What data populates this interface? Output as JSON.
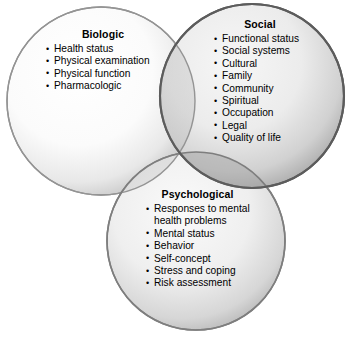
{
  "diagram": {
    "type": "venn-3-circle",
    "background_color": "#ffffff",
    "circles": [
      {
        "id": "biologic",
        "title": "Biologic",
        "border_color": "#8c8c8c",
        "fill_light": "#ffffff",
        "fill_dark": "#c9c9c9",
        "items": [
          "Health status",
          "Physical examination",
          "Physical function",
          "Pharmacologic"
        ]
      },
      {
        "id": "social",
        "title": "Social",
        "border_color": "#5a5a5a",
        "fill_light": "#f2f2f2",
        "fill_dark": "#a8a8a8",
        "items": [
          "Functional status",
          "Social systems",
          "Cultural",
          "Family",
          "Community",
          "Spiritual",
          "Occupation",
          "Legal",
          "Quality of life"
        ]
      },
      {
        "id": "psychological",
        "title": "Psychological",
        "border_color": "#7a7a7a",
        "fill_light": "#f7f7f7",
        "fill_dark": "#b5b5b5",
        "items": [
          "Responses to mental\nhealth problems",
          "Mental status",
          "Behavior",
          "Self-concept",
          "Stress and coping",
          "Risk assessment"
        ]
      }
    ]
  }
}
